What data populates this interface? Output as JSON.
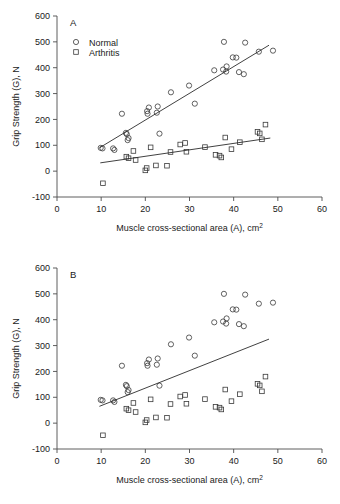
{
  "figure": {
    "panel_a_letter": "A",
    "panel_b_letter": "B"
  },
  "axes": {
    "y_title": "Grip Strength (G), N",
    "x_title_main": "Muscle cross-sectional area (A), cm",
    "x_title_sup": "2",
    "y_ticks": [
      "-100",
      "0",
      "100",
      "200",
      "300",
      "400",
      "500",
      "600"
    ],
    "x_ticks": [
      "0",
      "10",
      "20",
      "30",
      "40",
      "50",
      "60"
    ]
  },
  "legend": {
    "normal_label": "Normal",
    "arthritis_label": "Arthritis",
    "normal_marker": "circle-marker",
    "arthritis_marker": "square-marker"
  },
  "colors": {
    "axis": "#4d4d4d",
    "marker": "#3a3a3a",
    "line": "#2b2b2b",
    "background": "#ffffff"
  },
  "chart_data": {
    "type": "scatter",
    "title": "",
    "xlabel": "Muscle cross-sectional area (A), cm2",
    "ylabel": "Grip Strength (G), N",
    "xlim": [
      0,
      60
    ],
    "ylim": [
      -100,
      600
    ],
    "xticks": [
      0,
      10,
      20,
      30,
      40,
      50,
      60
    ],
    "yticks": [
      -100,
      0,
      100,
      200,
      300,
      400,
      500,
      600
    ],
    "grid": false,
    "legend_position": "upper-left",
    "panels": [
      {
        "label": "A",
        "description": "Separate regression lines fitted for each group",
        "series": [
          {
            "name": "Normal",
            "marker": "circle",
            "points": [
              [
                9.9,
                90
              ],
              [
                10.3,
                88
              ],
              [
                12.7,
                88
              ],
              [
                13.0,
                82
              ],
              [
                14.7,
                222
              ],
              [
                15.6,
                148
              ],
              [
                15.8,
                143
              ],
              [
                16.0,
                120
              ],
              [
                16.2,
                128
              ],
              [
                20.4,
                232
              ],
              [
                20.5,
                222
              ],
              [
                20.8,
                246
              ],
              [
                22.6,
                226
              ],
              [
                22.8,
                250
              ],
              [
                23.2,
                145
              ],
              [
                25.8,
                305
              ],
              [
                29.9,
                331
              ],
              [
                31.2,
                261
              ],
              [
                35.6,
                390
              ],
              [
                37.6,
                393
              ],
              [
                37.8,
                500
              ],
              [
                38.3,
                385
              ],
              [
                38.4,
                405
              ],
              [
                39.8,
                440
              ],
              [
                40.6,
                439
              ],
              [
                41.2,
                383
              ],
              [
                42.3,
                375
              ],
              [
                42.6,
                497
              ],
              [
                45.7,
                462
              ],
              [
                48.9,
                466
              ]
            ]
          },
          {
            "name": "Arthritis",
            "marker": "square",
            "points": [
              [
                10.4,
                -47
              ],
              [
                15.7,
                56
              ],
              [
                16.2,
                50
              ],
              [
                17.3,
                78
              ],
              [
                17.8,
                43
              ],
              [
                20.0,
                3
              ],
              [
                20.3,
                12
              ],
              [
                21.2,
                92
              ],
              [
                22.4,
                22
              ],
              [
                24.9,
                21
              ],
              [
                25.7,
                74
              ],
              [
                27.9,
                103
              ],
              [
                29.0,
                109
              ],
              [
                29.3,
                75
              ],
              [
                33.5,
                93
              ],
              [
                35.9,
                63
              ],
              [
                36.8,
                60
              ],
              [
                37.2,
                53
              ],
              [
                38.1,
                130
              ],
              [
                39.5,
                85
              ],
              [
                41.4,
                112
              ],
              [
                45.4,
                152
              ],
              [
                45.9,
                146
              ],
              [
                46.4,
                123
              ],
              [
                47.2,
                180
              ]
            ]
          }
        ],
        "fit_lines": [
          {
            "for_series": "Normal",
            "x_start": 9.6,
            "y_start": 90,
            "x_end": 48.0,
            "y_end": 487
          },
          {
            "for_series": "Arthritis",
            "x_start": 9.8,
            "y_start": 32,
            "x_end": 48.3,
            "y_end": 128
          }
        ]
      },
      {
        "label": "B",
        "description": "Single pooled regression line across both groups",
        "series": [
          {
            "name": "Normal",
            "marker": "circle",
            "points": [
              [
                9.9,
                90
              ],
              [
                10.3,
                88
              ],
              [
                12.7,
                88
              ],
              [
                13.0,
                82
              ],
              [
                14.7,
                222
              ],
              [
                15.6,
                148
              ],
              [
                15.8,
                143
              ],
              [
                16.0,
                120
              ],
              [
                16.2,
                128
              ],
              [
                20.4,
                232
              ],
              [
                20.5,
                222
              ],
              [
                20.8,
                246
              ],
              [
                22.6,
                226
              ],
              [
                22.8,
                250
              ],
              [
                23.2,
                145
              ],
              [
                25.8,
                305
              ],
              [
                29.9,
                331
              ],
              [
                31.2,
                261
              ],
              [
                35.6,
                390
              ],
              [
                37.6,
                393
              ],
              [
                37.8,
                500
              ],
              [
                38.3,
                385
              ],
              [
                38.4,
                405
              ],
              [
                39.8,
                440
              ],
              [
                40.6,
                439
              ],
              [
                41.2,
                383
              ],
              [
                42.3,
                375
              ],
              [
                42.6,
                497
              ],
              [
                45.7,
                462
              ],
              [
                48.9,
                466
              ]
            ]
          },
          {
            "name": "Arthritis",
            "marker": "square",
            "points": [
              [
                10.4,
                -47
              ],
              [
                15.7,
                56
              ],
              [
                16.2,
                50
              ],
              [
                17.3,
                78
              ],
              [
                17.8,
                43
              ],
              [
                20.0,
                3
              ],
              [
                20.3,
                12
              ],
              [
                21.2,
                92
              ],
              [
                22.4,
                22
              ],
              [
                24.9,
                21
              ],
              [
                25.7,
                74
              ],
              [
                27.9,
                103
              ],
              [
                29.0,
                109
              ],
              [
                29.3,
                75
              ],
              [
                33.5,
                93
              ],
              [
                35.9,
                63
              ],
              [
                36.8,
                60
              ],
              [
                37.2,
                53
              ],
              [
                38.1,
                130
              ],
              [
                39.5,
                85
              ],
              [
                41.4,
                112
              ],
              [
                45.4,
                152
              ],
              [
                45.9,
                146
              ],
              [
                46.4,
                123
              ],
              [
                47.2,
                180
              ]
            ]
          }
        ],
        "fit_lines": [
          {
            "for_series": "Pooled",
            "x_start": 9.6,
            "y_start": 65,
            "x_end": 48.0,
            "y_end": 325
          }
        ]
      }
    ]
  }
}
